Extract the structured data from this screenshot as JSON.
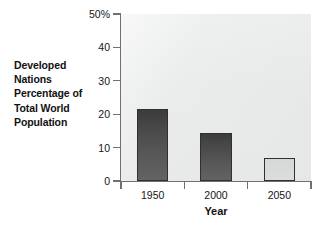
{
  "chart_data": {
    "type": "bar",
    "title": "",
    "subtitle": "",
    "categories": [
      "1950",
      "2000",
      "2050"
    ],
    "values": [
      21.5,
      14.5,
      7
    ],
    "xlabel": "Year",
    "ylabel": "Developed Nations Percentage of Total World Population",
    "ylabel_lines": [
      "Developed",
      "Nations",
      "Percentage of",
      "Total World",
      "Population"
    ],
    "ylim": [
      0,
      50
    ],
    "yticks": [
      0,
      10,
      20,
      30,
      40,
      50
    ],
    "ytick_labels": [
      "0",
      "10",
      "20",
      "30",
      "40",
      "50%"
    ],
    "grid": false,
    "legend": false,
    "legend_position": "none",
    "bar_colors": [
      "#4a4a4a",
      "#4a4a4a",
      "#d8d9d9"
    ],
    "plot_background": "#eceded",
    "axis_color": "#6f7072",
    "text_color": "#161616"
  }
}
